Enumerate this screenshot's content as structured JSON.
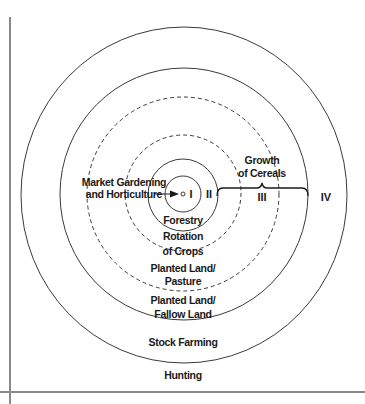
{
  "diagram": {
    "type": "concentric-zones",
    "zones_numerals": {
      "I": "I",
      "II": "II",
      "III": "III",
      "IV": "IV"
    },
    "labels": {
      "market_gardening_line1": "Market Gardening",
      "market_gardening_line2": "and Horticulture",
      "forestry": "Forestry",
      "rotation_line1": "Rotation",
      "rotation_line2": "of Crops",
      "planted_pasture_line1": "Planted Land/",
      "planted_pasture_line2": "Pasture",
      "planted_fallow_line1": "Planted Land/",
      "planted_fallow_line2": "Fallow Land",
      "stock_farming": "Stock Farming",
      "hunting": "Hunting",
      "growth_line1": "Growth",
      "growth_line2": "of Cereals"
    },
    "rings": [
      {
        "name": "city-center",
        "style": "solid",
        "rx": 2,
        "ry": 2
      },
      {
        "name": "ring-market-gardening",
        "style": "solid",
        "rx": 18,
        "ry": 18
      },
      {
        "name": "ring-forestry",
        "style": "solid",
        "rx": 35,
        "ry": 36
      },
      {
        "name": "ring-rotation-of-crops",
        "style": "dashed",
        "rx": 58,
        "ry": 58
      },
      {
        "name": "ring-planted-pasture",
        "style": "dashed",
        "rx": 96,
        "ry": 97
      },
      {
        "name": "ring-planted-fallow",
        "style": "solid",
        "rx": 124,
        "ry": 126
      },
      {
        "name": "ring-stock-farming",
        "style": "solid",
        "rx": 163,
        "ry": 168
      }
    ],
    "colors": {
      "line": "#3a3a3a",
      "text": "#1a1a1a",
      "frame": "#8a8a8a"
    }
  }
}
